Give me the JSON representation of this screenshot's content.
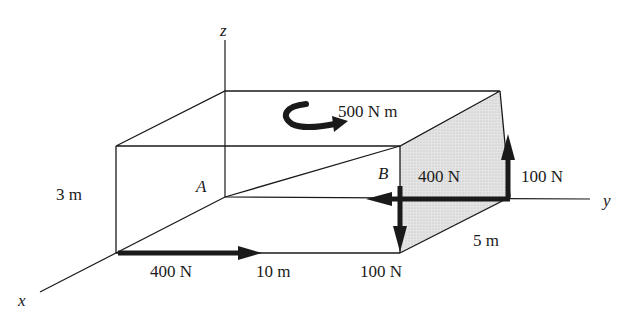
{
  "diagram": {
    "axes": {
      "x": "x",
      "y": "y",
      "z": "z"
    },
    "points": {
      "A": "A",
      "B": "B"
    },
    "dimensions": {
      "height": "3 m",
      "length": "10 m",
      "depth": "5 m"
    },
    "moment": {
      "label": "500 N m",
      "direction": "counterclockwise-about-z"
    },
    "forces": {
      "front_bottom": "400 N",
      "right_face_horizontal": "400 N",
      "right_face_up": "100 N",
      "front_corner_down": "100 N"
    },
    "colors": {
      "line": "#1a1a1a",
      "shade": "#d9d9d9",
      "background": "#ffffff"
    }
  }
}
